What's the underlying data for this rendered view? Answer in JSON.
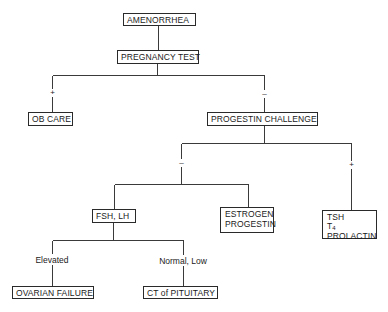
{
  "diagram": {
    "type": "flowchart",
    "nodes": {
      "amenorrhea": "AMENORRHEA",
      "pregnancy_test": "PREGNANCY TEST",
      "ob_care": "OB CARE",
      "progestin_challenge": "PROGESTIN CHALLENGE",
      "fsh_lh": "FSH, LH",
      "estrogen_progestin": [
        "ESTROGEN",
        "PROGESTIN"
      ],
      "tsh_t4_prolactin": {
        "line1": "TSH",
        "line2_base": "T",
        "line2_sub": "4",
        "line3": "PROLACTIN"
      },
      "ovarian_failure": "OVARIAN FAILURE",
      "ct_pituitary": "CT of PITUITARY"
    },
    "edge_labels": {
      "pregnancy_positive": "+",
      "pregnancy_negative": "–",
      "progestin_negative": "–",
      "progestin_positive": "+",
      "fsh_elevated": "Elevated",
      "fsh_normal_low": "Normal, Low"
    },
    "edges": [
      {
        "from": "AMENORRHEA",
        "to": "PREGNANCY TEST"
      },
      {
        "from": "PREGNANCY TEST",
        "to": "OB CARE",
        "label": "+"
      },
      {
        "from": "PREGNANCY TEST",
        "to": "PROGESTIN CHALLENGE",
        "label": "–"
      },
      {
        "from": "PROGESTIN CHALLENGE",
        "to": "FSH, LH",
        "label": "–"
      },
      {
        "from": "PROGESTIN CHALLENGE",
        "to": "ESTROGEN PROGESTIN",
        "label": "–"
      },
      {
        "from": "PROGESTIN CHALLENGE",
        "to": "TSH T4 PROLACTIN",
        "label": "+"
      },
      {
        "from": "FSH, LH",
        "to": "OVARIAN FAILURE",
        "label": "Elevated"
      },
      {
        "from": "FSH, LH",
        "to": "CT of PITUITARY",
        "label": "Normal, Low"
      }
    ]
  }
}
